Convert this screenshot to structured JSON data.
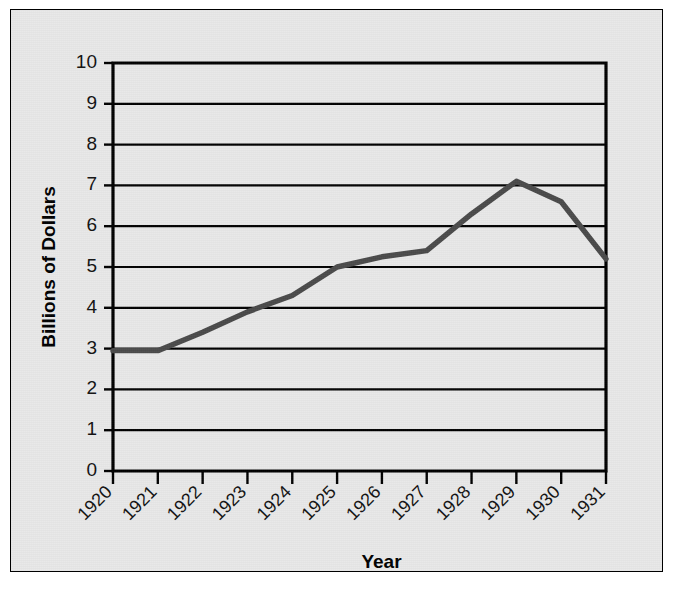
{
  "figure": {
    "background_color": "#e9e9e9",
    "border_color": "#000000",
    "line_color": "#4a4a4a"
  },
  "chart_data": {
    "type": "line",
    "title": "",
    "subtitle": "",
    "xlabel": "Year",
    "ylabel": "Billions of Dollars",
    "categories": [
      "1920",
      "1921",
      "1922",
      "1923",
      "1924",
      "1925",
      "1926",
      "1927",
      "1928",
      "1929",
      "1930",
      "1931"
    ],
    "values": [
      2.95,
      2.95,
      3.4,
      3.9,
      4.3,
      5.0,
      5.25,
      5.4,
      6.3,
      7.1,
      6.6,
      5.2
    ],
    "series": [
      {
        "name": "Billions of Dollars",
        "values": [
          2.95,
          2.95,
          3.4,
          3.9,
          4.3,
          5.0,
          5.25,
          5.4,
          6.3,
          7.1,
          6.6,
          5.2
        ]
      }
    ],
    "ylim": [
      0,
      10
    ],
    "ytick_labels": [
      "0",
      "1",
      "2",
      "3",
      "4",
      "5",
      "6",
      "7",
      "8",
      "9",
      "10"
    ],
    "ytick_values": [
      0,
      1,
      2,
      3,
      4,
      5,
      6,
      7,
      8,
      9,
      10
    ],
    "xtick_labels": [
      "1920",
      "1921",
      "1922",
      "1923",
      "1924",
      "1925",
      "1926",
      "1927",
      "1928",
      "1929",
      "1930",
      "1931"
    ],
    "xtick_rotation": -45,
    "grid": "horizontal",
    "legend": "none",
    "annotations": []
  }
}
